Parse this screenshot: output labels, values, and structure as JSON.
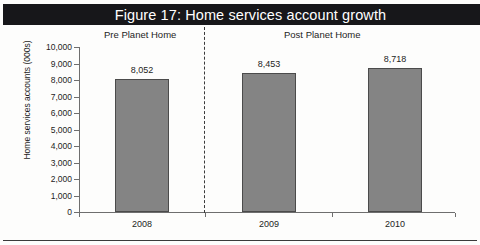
{
  "figure": {
    "title": "Figure 17: Home services account growth"
  },
  "annotations": {
    "pre_label": "Pre Planet Home",
    "post_label": "Post Planet Home"
  },
  "colors": {
    "title_band": "#17171a",
    "title_text": "#ffffff",
    "bar_fill": "#848484",
    "bar_stroke": "#4b4b4b",
    "axis": "#6e6e6e",
    "text": "#1d1d1d",
    "divider": "#3a3a3a",
    "page_background": "#ffffff"
  },
  "chart_data": {
    "type": "bar",
    "title": "Figure 17: Home services account growth",
    "xlabel": "",
    "ylabel": "Home services accounts (000s)",
    "categories": [
      "2008",
      "2009",
      "2010"
    ],
    "values": [
      8052,
      8453,
      8718
    ],
    "value_labels": [
      "8,052",
      "8,453",
      "8,718"
    ],
    "ylim": [
      0,
      10000
    ],
    "ytick_values": [
      0,
      1000,
      2000,
      3000,
      4000,
      5000,
      6000,
      7000,
      8000,
      9000,
      10000
    ],
    "ytick_labels": [
      "0",
      "1,000",
      "2,000",
      "3,000",
      "4,000",
      "5,000",
      "6,000",
      "7,000",
      "8,000",
      "9,000",
      "10,000"
    ],
    "grid": false,
    "legend": false,
    "annotations": [
      {
        "text": "Pre Planet Home",
        "applies_to": [
          "2008"
        ]
      },
      {
        "text": "Post Planet Home",
        "applies_to": [
          "2009",
          "2010"
        ]
      }
    ],
    "divider": {
      "type": "dashed-vertical",
      "between": [
        "2008",
        "2009"
      ]
    }
  }
}
